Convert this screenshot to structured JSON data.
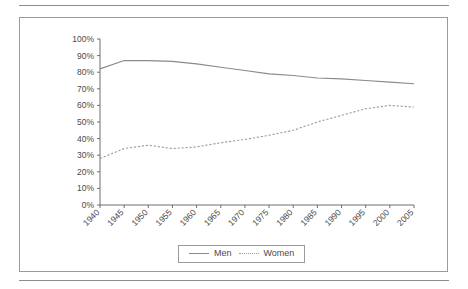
{
  "chart_data": {
    "type": "line",
    "title": "",
    "subtitle": "",
    "xlabel": "",
    "ylabel": "",
    "grid": false,
    "legend_position": "bottom-center",
    "ylim": [
      0,
      100
    ],
    "y_unit": "%",
    "y_ticks": [
      "0%",
      "10%",
      "20%",
      "30%",
      "40%",
      "50%",
      "60%",
      "70%",
      "80%",
      "90%",
      "100%"
    ],
    "y_tick_values": [
      0,
      10,
      20,
      30,
      40,
      50,
      60,
      70,
      80,
      90,
      100
    ],
    "categories": [
      "1940",
      "1945",
      "1950",
      "1955",
      "1960",
      "1965",
      "1970",
      "1975",
      "1980",
      "1985",
      "1990",
      "1995",
      "2000",
      "2005"
    ],
    "x": [
      1940,
      1945,
      1950,
      1955,
      1960,
      1965,
      1970,
      1975,
      1980,
      1985,
      1990,
      1995,
      2000,
      2005
    ],
    "series": [
      {
        "name": "Men",
        "style": "solid",
        "color": "#8a8a8a",
        "values": [
          82,
          87,
          87,
          86.5,
          85,
          83,
          81,
          79,
          78,
          76.5,
          76,
          75,
          74,
          73
        ]
      },
      {
        "name": "Women",
        "style": "dotted",
        "color": "#9b9b9b",
        "values": [
          28,
          34,
          36,
          34,
          35,
          37.5,
          39.5,
          42,
          45,
          50,
          54,
          58,
          60,
          59
        ]
      }
    ],
    "annotations": []
  },
  "legend": {
    "entries": [
      {
        "label": "Men",
        "style": "solid"
      },
      {
        "label": "Women",
        "style": "dotted"
      }
    ]
  },
  "colors": {
    "frame": "#9a9a9a",
    "rule": "#8d8d8d",
    "axis": "#6f6f6f",
    "men_line": "#8a8a8a",
    "women_line": "#9b9b9b",
    "background": "#ffffff",
    "text": "#4a4a4a"
  }
}
